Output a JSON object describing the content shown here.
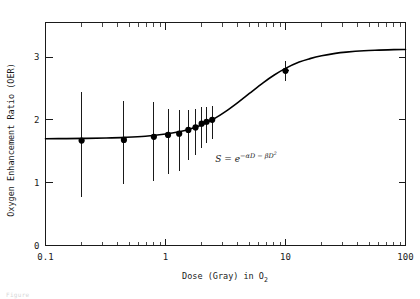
{
  "chart_data": {
    "type": "scatter",
    "title": "",
    "xlabel": "Dose (Gray) in O",
    "xlabel_sub": "2",
    "xlabel_full": "Dose (Gray) in O2",
    "ylabel": "Oxygen Enhancement Ratio (OER)",
    "xscale": "log",
    "yscale": "linear",
    "xlim": [
      0.1,
      100
    ],
    "ylim": [
      0,
      3.55
    ],
    "xticks": [
      0.1,
      1,
      10,
      100
    ],
    "xtick_labels": [
      "0.1",
      "1",
      "10",
      "100"
    ],
    "yticks": [
      0,
      1,
      2,
      3
    ],
    "ytick_labels": [
      "0",
      "1",
      "2",
      "3"
    ],
    "grid": false,
    "legend": "none",
    "frame": "box",
    "tick_direction": "in",
    "annotations": [
      {
        "name": "survival-equation",
        "text": "S = e",
        "exponent": "-aD - bD",
        "exponent_sup": "2",
        "full": "S = e^(-aD - bD^2)",
        "x": 2.6,
        "y": 1.33
      }
    ],
    "points": [
      {
        "x": 0.2,
        "y": 1.67,
        "yerr_low": 0.9,
        "yerr_high": 0.77
      },
      {
        "x": 0.45,
        "y": 1.68,
        "yerr_low": 0.7,
        "yerr_high": 0.62
      },
      {
        "x": 0.8,
        "y": 1.73,
        "yerr_low": 0.7,
        "yerr_high": 0.55
      },
      {
        "x": 1.05,
        "y": 1.76,
        "yerr_low": 0.62,
        "yerr_high": 0.42
      },
      {
        "x": 1.3,
        "y": 1.78,
        "yerr_low": 0.6,
        "yerr_high": 0.38
      },
      {
        "x": 1.55,
        "y": 1.84,
        "yerr_low": 0.48,
        "yerr_high": 0.32
      },
      {
        "x": 1.78,
        "y": 1.88,
        "yerr_low": 0.44,
        "yerr_high": 0.3
      },
      {
        "x": 2.0,
        "y": 1.94,
        "yerr_low": 0.38,
        "yerr_high": 0.26
      },
      {
        "x": 2.2,
        "y": 1.97,
        "yerr_low": 0.34,
        "yerr_high": 0.24
      },
      {
        "x": 2.45,
        "y": 2.0,
        "yerr_low": 0.3,
        "yerr_high": 0.22
      },
      {
        "x": 10.0,
        "y": 2.78,
        "yerr_low": 0.16,
        "yerr_high": 0.16
      }
    ],
    "curve": {
      "name": "sigmoid-fit",
      "description": "sigmoidal OER fit curve",
      "y_min": 1.7,
      "y_max": 3.12,
      "points": [
        {
          "x": 0.1,
          "y": 1.7
        },
        {
          "x": 0.15,
          "y": 1.702
        },
        {
          "x": 0.22,
          "y": 1.706
        },
        {
          "x": 0.32,
          "y": 1.712
        },
        {
          "x": 0.46,
          "y": 1.722
        },
        {
          "x": 0.68,
          "y": 1.74
        },
        {
          "x": 1.0,
          "y": 1.775
        },
        {
          "x": 1.3,
          "y": 1.812
        },
        {
          "x": 1.6,
          "y": 1.855
        },
        {
          "x": 2.0,
          "y": 1.92
        },
        {
          "x": 2.5,
          "y": 2.01
        },
        {
          "x": 3.2,
          "y": 2.14
        },
        {
          "x": 4.0,
          "y": 2.275
        },
        {
          "x": 5.0,
          "y": 2.42
        },
        {
          "x": 6.5,
          "y": 2.59
        },
        {
          "x": 8.0,
          "y": 2.71
        },
        {
          "x": 10.0,
          "y": 2.82
        },
        {
          "x": 13.0,
          "y": 2.92
        },
        {
          "x": 16.0,
          "y": 2.975
        },
        {
          "x": 20.0,
          "y": 3.02
        },
        {
          "x": 26.0,
          "y": 3.058
        },
        {
          "x": 32.0,
          "y": 3.078
        },
        {
          "x": 45.0,
          "y": 3.1
        },
        {
          "x": 60.0,
          "y": 3.11
        },
        {
          "x": 80.0,
          "y": 3.118
        },
        {
          "x": 100.0,
          "y": 3.12
        }
      ]
    },
    "colors": {
      "axis": "#1a1a1a",
      "curve": "#000000",
      "marker": "#000000",
      "errorbar": "#1a1a1a",
      "background": "#ffffff"
    }
  },
  "caption": {
    "text": "Figure"
  }
}
